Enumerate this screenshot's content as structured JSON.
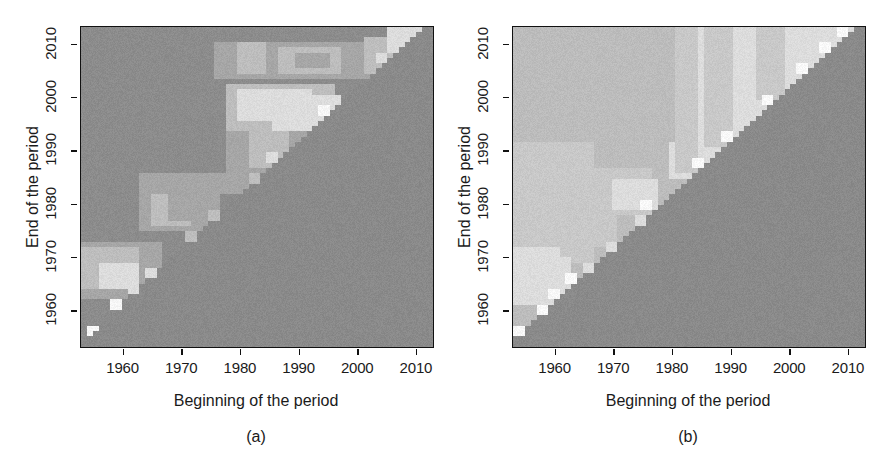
{
  "figure": {
    "panel_count": 2,
    "background_color": "#ffffff",
    "text_color": "#1a1a1a"
  },
  "chart_data": [
    {
      "type": "heatmap",
      "panel_label": "(a)",
      "title": "",
      "xlabel": "Beginning of the period",
      "ylabel": "End of the period",
      "xlim": [
        1953,
        2013
      ],
      "ylim": [
        1953,
        2013
      ],
      "xticks": [
        1960,
        1970,
        1980,
        1990,
        2000,
        2010
      ],
      "yticks": [
        1960,
        1970,
        1980,
        1990,
        2000,
        2010
      ],
      "xtick_labels": [
        "1960",
        "1970",
        "1980",
        "1990",
        "2000",
        "2010"
      ],
      "ytick_labels": [
        "1960",
        "1970",
        "1980",
        "1990",
        "2000",
        "2010"
      ],
      "grid": false,
      "legend": "none",
      "cell_years": 61,
      "colors": {
        "below_diagonal": "#8a8a8a",
        "base": "#8c8c8c",
        "light": "#a6a6a6",
        "lighter": "#bdbdbd",
        "bright": "#dcdcdc",
        "peak": "#f6f6f6",
        "frame": "#111111"
      },
      "noise_amplitude": 7,
      "description": "Mostly uniform mid-gray field above the diagonal with faint lighter rectangular patches and isolated bright cells hugging the diagonal.",
      "regions": [
        {
          "x0": 1953,
          "x1": 2013,
          "y0": 1953,
          "y1": 2013,
          "tone": "base"
        },
        {
          "x0": 1953,
          "x1": 1966,
          "y0": 1962,
          "y1": 1972,
          "tone": "light"
        },
        {
          "x0": 1953,
          "x1": 1962,
          "y0": 1964,
          "y1": 1971,
          "tone": "lighter"
        },
        {
          "x0": 1956,
          "x1": 1962,
          "y0": 1964,
          "y1": 1968,
          "tone": "bright"
        },
        {
          "x0": 1963,
          "x1": 1976,
          "y0": 1975,
          "y1": 1982,
          "tone": "light"
        },
        {
          "x0": 1965,
          "x1": 1971,
          "y0": 1976,
          "y1": 1981,
          "tone": "lighter"
        },
        {
          "x0": 1968,
          "x1": 1972,
          "y0": 1977,
          "y1": 1981,
          "tone": "light"
        },
        {
          "x0": 1963,
          "x1": 1986,
          "y0": 1982,
          "y1": 1985,
          "tone": "light"
        },
        {
          "x0": 1978,
          "x1": 1996,
          "y0": 1993,
          "y1": 2002,
          "tone": "lighter"
        },
        {
          "x0": 1980,
          "x1": 1992,
          "y0": 1996,
          "y1": 2001,
          "tone": "bright"
        },
        {
          "x0": 1986,
          "x1": 1997,
          "y0": 1994,
          "y1": 2000,
          "tone": "bright"
        },
        {
          "x0": 1978,
          "x1": 1993,
          "y0": 1986,
          "y1": 1993,
          "tone": "light"
        },
        {
          "x0": 1982,
          "x1": 1988,
          "y0": 1987,
          "y1": 1993,
          "tone": "lighter"
        },
        {
          "x0": 1976,
          "x1": 2009,
          "y0": 2004,
          "y1": 2010,
          "tone": "light"
        },
        {
          "x0": 1980,
          "x1": 1984,
          "y0": 2005,
          "y1": 2010,
          "tone": "lighter"
        },
        {
          "x0": 1987,
          "x1": 1997,
          "y0": 2005,
          "y1": 2009,
          "tone": "lighter"
        },
        {
          "x0": 1990,
          "x1": 1995,
          "y0": 2006,
          "y1": 2008,
          "tone": "light"
        },
        {
          "x0": 2002,
          "x1": 2008,
          "y0": 2005,
          "y1": 2011,
          "tone": "lighter"
        },
        {
          "x0": 2006,
          "x1": 2011,
          "y0": 2009,
          "y1": 2013,
          "tone": "bright"
        }
      ],
      "diagonal_hotspots": [
        {
          "x": 1954,
          "y": 1955,
          "tone": "peak"
        },
        {
          "x": 1958,
          "y": 1960,
          "tone": "peak"
        },
        {
          "x": 1961,
          "y": 1963,
          "tone": "bright"
        },
        {
          "x": 1964,
          "y": 1966,
          "tone": "bright"
        },
        {
          "x": 1971,
          "y": 1973,
          "tone": "lighter"
        },
        {
          "x": 1975,
          "y": 1977,
          "tone": "lighter"
        },
        {
          "x": 1982,
          "y": 1984,
          "tone": "lighter"
        },
        {
          "x": 1985,
          "y": 1988,
          "tone": "bright"
        },
        {
          "x": 1994,
          "y": 1997,
          "tone": "peak"
        },
        {
          "x": 1995,
          "y": 1999,
          "tone": "bright"
        },
        {
          "x": 2004,
          "y": 2007,
          "tone": "bright"
        },
        {
          "x": 2009,
          "y": 2012,
          "tone": "bright"
        }
      ]
    },
    {
      "type": "heatmap",
      "panel_label": "(b)",
      "title": "",
      "xlabel": "Beginning of the period",
      "ylabel": "End of the period",
      "xlim": [
        1953,
        2013
      ],
      "ylim": [
        1953,
        2013
      ],
      "xticks": [
        1960,
        1970,
        1980,
        1990,
        2000,
        2010
      ],
      "yticks": [
        1960,
        1970,
        1980,
        1990,
        2000,
        2010
      ],
      "xtick_labels": [
        "1960",
        "1970",
        "1980",
        "1990",
        "2000",
        "2010"
      ],
      "ytick_labels": [
        "1960",
        "1970",
        "1980",
        "1990",
        "2000",
        "2010"
      ],
      "grid": false,
      "legend": "none",
      "cell_years": 61,
      "colors": {
        "below_diagonal": "#8a8a8a",
        "base": "#8c8c8c",
        "light": "#bcbcbc",
        "lighter": "#c8c8c8",
        "bright": "#dcdcdc",
        "peak": "#f8f8f8",
        "frame": "#111111"
      },
      "noise_amplitude": 7,
      "description": "Broad light upper-left triangle above the diagonal; brighter near-white vertical bands begin around 1980 and continue to 2013; dark gray below the diagonal.",
      "regions": [
        {
          "x0": 1953,
          "x1": 2013,
          "y0": 1953,
          "y1": 2013,
          "tone": "light"
        },
        {
          "x0": 1953,
          "x1": 1966,
          "y0": 1969,
          "y1": 1992,
          "tone": "lighter"
        },
        {
          "x0": 1953,
          "x1": 1960,
          "y0": 1961,
          "y1": 1971,
          "tone": "bright"
        },
        {
          "x0": 1955,
          "x1": 1962,
          "y0": 1963,
          "y1": 1969,
          "tone": "bright"
        },
        {
          "x0": 1966,
          "x1": 1976,
          "y0": 1978,
          "y1": 1986,
          "tone": "lighter"
        },
        {
          "x0": 1970,
          "x1": 1977,
          "y0": 1979,
          "y1": 1984,
          "tone": "bright"
        },
        {
          "x0": 1980,
          "x1": 2013,
          "y0": 1985,
          "y1": 2013,
          "tone": "bright"
        },
        {
          "x0": 1981,
          "x1": 1984,
          "y0": 1986,
          "y1": 2013,
          "tone": "lighter"
        },
        {
          "x0": 1986,
          "x1": 1990,
          "y0": 1991,
          "y1": 2013,
          "tone": "lighter"
        },
        {
          "x0": 1995,
          "x1": 1999,
          "y0": 2000,
          "y1": 2013,
          "tone": "lighter"
        },
        {
          "x0": 2000,
          "x1": 2004,
          "y0": 2005,
          "y1": 2013,
          "tone": "bright"
        },
        {
          "x0": 1992,
          "x1": 1994,
          "y0": 1997,
          "y1": 2013,
          "tone": "bright"
        },
        {
          "x0": 1953,
          "x1": 1980,
          "y0": 1992,
          "y1": 2013,
          "tone": "light"
        },
        {
          "x0": 1960,
          "x1": 1970,
          "y0": 1972,
          "y1": 1978,
          "tone": "lighter"
        }
      ],
      "diagonal_hotspots": [
        {
          "x": 1953,
          "y": 1955,
          "tone": "peak"
        },
        {
          "x": 1957,
          "y": 1959,
          "tone": "peak"
        },
        {
          "x": 1959,
          "y": 1962,
          "tone": "peak"
        },
        {
          "x": 1962,
          "y": 1965,
          "tone": "peak"
        },
        {
          "x": 1965,
          "y": 1967,
          "tone": "bright"
        },
        {
          "x": 1969,
          "y": 1971,
          "tone": "bright"
        },
        {
          "x": 1974,
          "y": 1976,
          "tone": "bright"
        },
        {
          "x": 1975,
          "y": 1979,
          "tone": "peak"
        },
        {
          "x": 1984,
          "y": 1987,
          "tone": "peak"
        },
        {
          "x": 1989,
          "y": 1992,
          "tone": "peak"
        },
        {
          "x": 1996,
          "y": 1999,
          "tone": "peak"
        },
        {
          "x": 2002,
          "y": 2005,
          "tone": "peak"
        },
        {
          "x": 2006,
          "y": 2009,
          "tone": "peak"
        },
        {
          "x": 2009,
          "y": 2012,
          "tone": "peak"
        }
      ]
    }
  ]
}
